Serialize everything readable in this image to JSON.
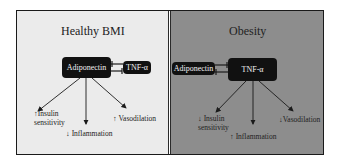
{
  "figure": {
    "panels": [
      {
        "id": "healthy",
        "title": "Healthy BMI",
        "background": "#ebebeb",
        "nodes": {
          "primary": "Adiponectin",
          "secondary": "TNF-α"
        },
        "relation": "mutual inhibition (Adiponectin dominant)",
        "effects": [
          {
            "arrow": "↑",
            "text_line1": "Insulin",
            "text_line2": "sensitivity"
          },
          {
            "arrow": "↓",
            "text_line1": "Inflammation"
          },
          {
            "arrow": "↑",
            "text_line1": "Vasodilation"
          }
        ]
      },
      {
        "id": "obesity",
        "title": "Obesity",
        "background": "#8d8d8d",
        "nodes": {
          "primary": "TNF-α",
          "secondary": "Adiponectin"
        },
        "relation": "mutual inhibition (TNF-α dominant)",
        "effects": [
          {
            "arrow": "↓",
            "text_line1": "Insulin",
            "text_line2": "sensitivity"
          },
          {
            "arrow": "↑",
            "text_line1": "Inflammation"
          },
          {
            "arrow": "↓",
            "text_line1": "Vasodilation"
          }
        ]
      }
    ]
  }
}
